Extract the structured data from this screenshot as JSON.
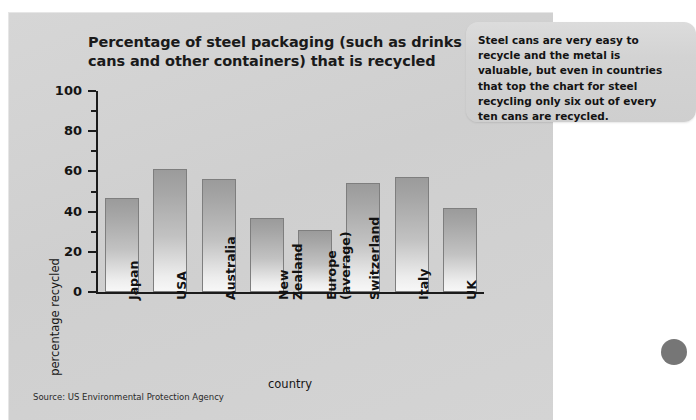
{
  "chart_data": {
    "type": "bar",
    "title": "Percentage of steel packaging (such as drinks cans and other containers) that is recycled",
    "xlabel": "country",
    "ylabel": "percentage recycled",
    "ylim": [
      0,
      100
    ],
    "ytick_step": 20,
    "yminor_step": 10,
    "grid": false,
    "legend": "none",
    "categories": [
      "Japan",
      "USA",
      "Australia",
      "New Zealand",
      "Europe (average)",
      "Switzerland",
      "Italy",
      "UK"
    ],
    "values": [
      47,
      61,
      56,
      37,
      31,
      54,
      57,
      42
    ],
    "ytick_labels": [
      "100",
      "80",
      "60",
      "40",
      "20",
      "0"
    ],
    "ytick_values": [
      100,
      80,
      60,
      40,
      20,
      0
    ]
  },
  "chart": {
    "title_line1": "Percentage of steel packaging (such as drinks",
    "title_line2": "cans and other containers) that is recycled",
    "y_axis_title": "percentage recycled",
    "x_axis_title": "country",
    "bar_labels": [
      {
        "line1": "Japan",
        "line2": ""
      },
      {
        "line1": "USA",
        "line2": ""
      },
      {
        "line1": "Australia",
        "line2": ""
      },
      {
        "line1": "New",
        "line2": "Zealand"
      },
      {
        "line1": "Europe",
        "line2": "(average)"
      },
      {
        "line1": "Switzerland",
        "line2": ""
      },
      {
        "line1": "Italy",
        "line2": ""
      },
      {
        "line1": "UK",
        "line2": ""
      }
    ]
  },
  "callout": {
    "text": "Steel cans are very easy to recycle and the metal is valuable, but even in countries that top the chart for steel recycling only six out of every ten cans are recycled."
  },
  "footer": {
    "source": "Source: US Environmental Protection Agency"
  },
  "colors": {
    "panel_background": "#d2d2d2",
    "bar_top": "#9b9b9b",
    "bar_bottom": "#f7f7f7",
    "bar_border": "#7e7e7e",
    "axis": "#1b1b1b",
    "text": "#141414",
    "callout_background": "#d6d6d6",
    "page_dot": "#767676"
  }
}
